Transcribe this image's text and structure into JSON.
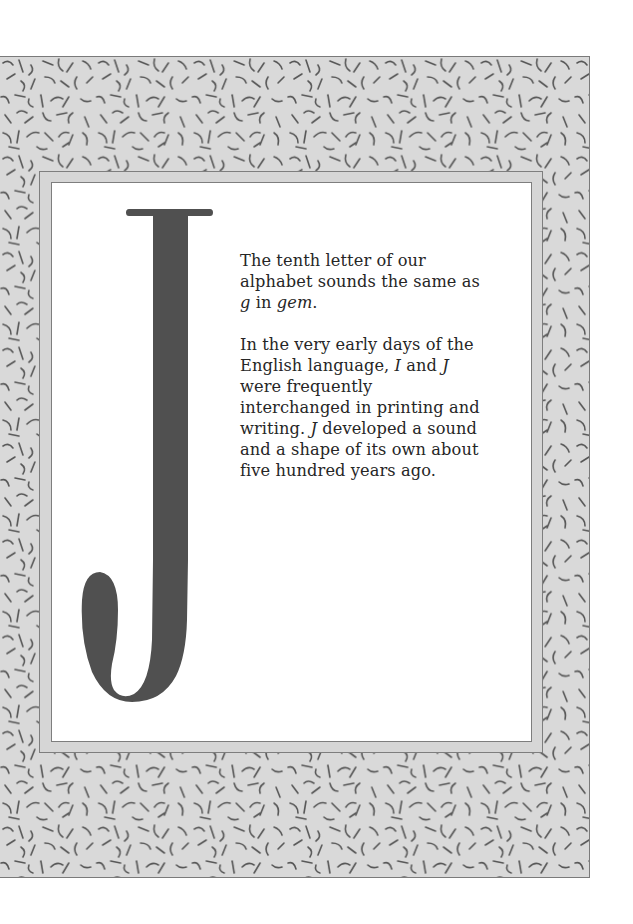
{
  "page": {
    "letter": "J",
    "colors": {
      "pattern_background": "#d9d9d9",
      "pattern_stroke": "#555555",
      "mat": "#d6d6d6",
      "mat_border": "#7e7e7e",
      "panel": "#ffffff",
      "letter_fill": "#505050",
      "text": "#262626"
    },
    "paragraphs": [
      {
        "segments": [
          {
            "text": "The tenth letter of our alphabet sounds the same as ",
            "italic": false
          },
          {
            "text": "g",
            "italic": true
          },
          {
            "text": " in ",
            "italic": false
          },
          {
            "text": "gem",
            "italic": true
          },
          {
            "text": ".",
            "italic": false
          }
        ]
      },
      {
        "segments": [
          {
            "text": "In the very early days of the English language, ",
            "italic": false
          },
          {
            "text": "I",
            "italic": true
          },
          {
            "text": " and ",
            "italic": false
          },
          {
            "text": "J",
            "italic": true
          },
          {
            "text": " were frequently interchanged in printing and writing. ",
            "italic": false
          },
          {
            "text": "J",
            "italic": true
          },
          {
            "text": " developed a sound and a shape of its own about five hundred years ago.",
            "italic": false
          }
        ]
      }
    ]
  }
}
